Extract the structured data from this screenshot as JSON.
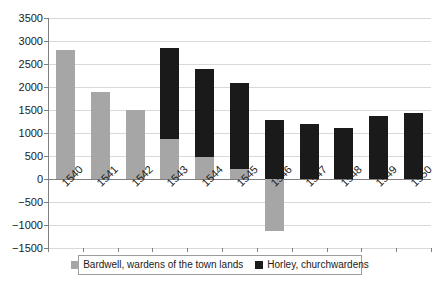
{
  "chart_data": {
    "type": "bar",
    "stacked": true,
    "title": "",
    "xlabel": "",
    "ylabel": "",
    "categories": [
      "1540",
      "1541",
      "1542",
      "1543",
      "1544",
      "1545",
      "1546",
      "1547",
      "1548",
      "1549",
      "1550"
    ],
    "series": [
      {
        "name": "Bardwell, wardens of the town lands",
        "color": "#a6a6a6",
        "values": [
          2800,
          1890,
          1490,
          880,
          470,
          210,
          -1140,
          0,
          0,
          0,
          0
        ]
      },
      {
        "name": "Horley, churchwardens",
        "color": "#1a1a1a",
        "values": [
          0,
          0,
          0,
          1970,
          1920,
          1880,
          1290,
          1200,
          1100,
          1360,
          1440
        ]
      }
    ],
    "stack_totals_positive": [
      2800,
      1890,
      1490,
      2850,
      2390,
      2090,
      1290,
      1200,
      1100,
      1360,
      1440
    ],
    "ylim": [
      -1500,
      3500
    ],
    "ytick_step": 500,
    "yticks": [
      "3500",
      "3000",
      "2500",
      "2000",
      "1500",
      "1000",
      "500",
      "0",
      "-500",
      "-1000",
      "-1500"
    ],
    "grid": true,
    "legend_position": "bottom"
  },
  "legend": {
    "entries": [
      {
        "label": "Bardwell, wardens of the town lands",
        "color": "#a6a6a6"
      },
      {
        "label": "Horley, churchwardens",
        "color": "#1a1a1a"
      }
    ]
  }
}
